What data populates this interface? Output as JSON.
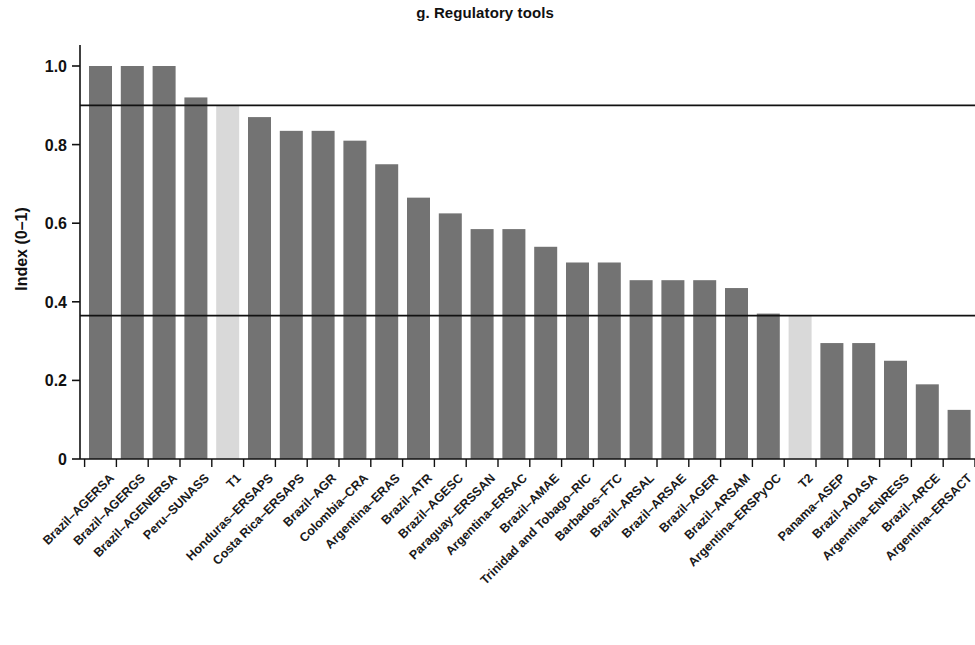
{
  "chart_data": {
    "type": "bar",
    "title": "g. Regulatory tools",
    "xlabel": "",
    "ylabel": "Index (0–1)",
    "ylim": [
      0,
      1.05
    ],
    "yticks": [
      0,
      0.2,
      0.4,
      0.6,
      0.8,
      1.0
    ],
    "ytick_labels": [
      "0",
      "0.2",
      "0.4",
      "0.6",
      "0.8",
      "1.0"
    ],
    "grid": false,
    "legend": "none",
    "bar_color": "#737373",
    "highlight_color": "#d9d9d9",
    "reference_lines": [
      {
        "label": "T1",
        "value": 0.9
      },
      {
        "label": "T2",
        "value": 0.365
      }
    ],
    "categories": [
      "Brazil–AGERSA",
      "Brazil–AGERGS",
      "Brazil–AGENERSA",
      "Peru–SUNASS",
      "T1",
      "Honduras–ERSAPS",
      "Costa Rica–ERSAPS",
      "Brazil–AGR",
      "Colombia–CRA",
      "Argentina–ERAS",
      "Brazil–ATR",
      "Brazil–AGESC",
      "Paraguay–ERSSAN",
      "Argentina–ERSAC",
      "Brazil–AMAE",
      "Trinidad and Tobago–RIC",
      "Barbados–FTC",
      "Brazil–ARSAL",
      "Brazil–ARSAE",
      "Brazil–AGER",
      "Brazil–ARSAM",
      "Argentina–ERSPyOC",
      "T2",
      "Panama–ASEP",
      "Brazil–ADASA",
      "Argentina–ENRESS",
      "Brazil–ARCE",
      "Argentina–ERSACT"
    ],
    "values": [
      1.0,
      1.0,
      1.0,
      0.92,
      0.9,
      0.87,
      0.835,
      0.835,
      0.81,
      0.75,
      0.665,
      0.625,
      0.585,
      0.585,
      0.54,
      0.5,
      0.5,
      0.455,
      0.455,
      0.455,
      0.435,
      0.37,
      0.365,
      0.295,
      0.295,
      0.25,
      0.19,
      0.125
    ],
    "highlighted": [
      "T1",
      "T2"
    ]
  }
}
